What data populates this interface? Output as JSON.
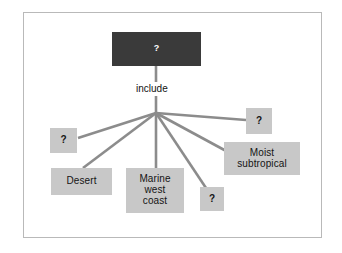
{
  "diagram": {
    "type": "concept-map",
    "background_color": "#ffffff",
    "frame_color": "#b9b9b9",
    "root_color": "#3a3a3a",
    "node_color": "#c8c8c8",
    "connector_color": "#8c8c8c",
    "root": {
      "label": "?",
      "text_color": "#ffffff"
    },
    "edge_label": "include",
    "children": [
      {
        "id": "unknown-left",
        "label": "?"
      },
      {
        "id": "desert",
        "label": "Desert"
      },
      {
        "id": "marine-west-coast",
        "label": "Marine\nwest\ncoast"
      },
      {
        "id": "unknown-bottom",
        "label": "?"
      },
      {
        "id": "moist-subtropical",
        "label": "Moist\nsubtropical"
      },
      {
        "id": "unknown-top-right",
        "label": "?"
      }
    ]
  }
}
